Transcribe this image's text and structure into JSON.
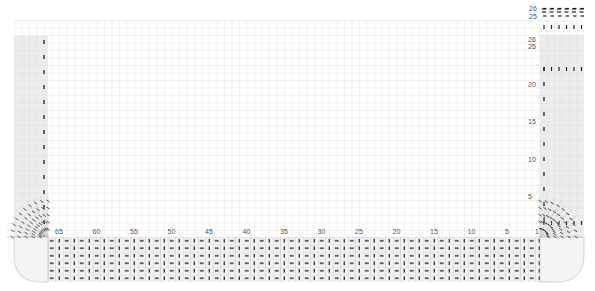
{
  "chart": {
    "grid": {
      "cell_size": 7.5,
      "line_color": "#d4d4d4",
      "band_fill": "#ececec",
      "stitch_color": "#222222"
    },
    "stitch_axis": {
      "direction": "right-to-left",
      "labels": [
        "65",
        "60",
        "55",
        "50",
        "45",
        "40",
        "35",
        "30",
        "25",
        "20",
        "15",
        "10",
        "5",
        "1"
      ],
      "total": 65
    },
    "row_axis": {
      "direction": "bottom-to-top",
      "labels": [
        "26",
        "25",
        "20",
        "15",
        "10",
        "5"
      ],
      "total": 26
    },
    "symbols": {
      "knit": "dash",
      "purl": "vertical-bar"
    },
    "sections": {
      "left_band": "shaded rib column",
      "right_band": "shaded rib column",
      "bottom_band": "rib border rows",
      "corners": "mitred curved corners"
    }
  },
  "chart_data": {
    "type": "heatmap",
    "title": "",
    "xlabel": "Stitches",
    "ylabel": "Rows",
    "x_ticks": [
      65,
      60,
      55,
      50,
      45,
      40,
      35,
      30,
      25,
      20,
      15,
      10,
      5,
      1
    ],
    "y_ticks": [
      26,
      25,
      20,
      15,
      10,
      5
    ],
    "xlim": [
      65,
      1
    ],
    "ylim": [
      1,
      26
    ],
    "grid": true,
    "legend": []
  }
}
